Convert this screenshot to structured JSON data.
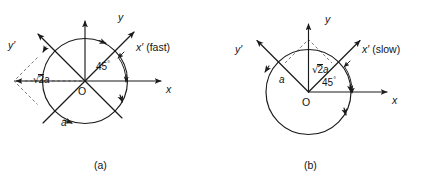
{
  "figure": {
    "panels": [
      {
        "id": "a",
        "caption": "(a)",
        "axes": {
          "y_label": "y",
          "x_label": "x",
          "y_prime_label": "y′",
          "x_prime_label": "x′",
          "x_prime_note": "(fast)"
        },
        "origin_label": "O",
        "angle_label": "45",
        "angle_unit": "°",
        "radius_label": "a",
        "diagonal_label_radical": "√",
        "diagonal_label_radicand": "2",
        "diagonal_label_suffix": "a",
        "diagonal_label_full": "√2a"
      },
      {
        "id": "b",
        "caption": "(b)",
        "axes": {
          "y_label": "y",
          "x_label": "x",
          "y_prime_label": "y′",
          "x_prime_label": "x′",
          "x_prime_note": "(slow)"
        },
        "origin_label": "O",
        "angle_label": "45",
        "angle_unit": "°",
        "radius_label": "a",
        "diagonal_label_radical": "√",
        "diagonal_label_radicand": "2",
        "diagonal_label_suffix": "a",
        "diagonal_label_full": "√2a"
      }
    ],
    "colors": {
      "ink": "#1b1b1b",
      "dashed": "#6b6b6b",
      "background": "#ffffff"
    }
  }
}
